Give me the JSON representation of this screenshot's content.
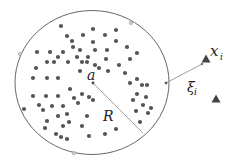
{
  "diagram": {
    "colors": {
      "circle_stroke": "#555555",
      "dot_fill": "#555555",
      "support_vector_fill": "#c8c8c8",
      "triangle_fill": "#444444",
      "line": "#888888",
      "text": "#222222"
    },
    "sphere": {
      "cx": 92,
      "cy": 82.5,
      "rx": 77,
      "ry": 72
    },
    "labels": {
      "center": "a",
      "radius": "R",
      "outlier": "x",
      "outlier_sub": "i",
      "slack": "ξ",
      "slack_sub": "i"
    },
    "support_vectors": [
      [
        131,
        23
      ],
      [
        20,
        54
      ],
      [
        74,
        153
      ],
      [
        166,
        83
      ]
    ],
    "outliers": [
      [
        206,
        59
      ],
      [
        216,
        99
      ]
    ],
    "points": [
      [
        61,
        26
      ],
      [
        116,
        30
      ],
      [
        93,
        29
      ],
      [
        67,
        36
      ],
      [
        83,
        35
      ],
      [
        105,
        35
      ],
      [
        72,
        41
      ],
      [
        93,
        42
      ],
      [
        116,
        41
      ],
      [
        127,
        47
      ],
      [
        73,
        47
      ],
      [
        80,
        50
      ],
      [
        95,
        50
      ],
      [
        107,
        50
      ],
      [
        37,
        52
      ],
      [
        50,
        52
      ],
      [
        63,
        52
      ],
      [
        137,
        53
      ],
      [
        58,
        57
      ],
      [
        77,
        57
      ],
      [
        88,
        57
      ],
      [
        106,
        59
      ],
      [
        130,
        59
      ],
      [
        47,
        62
      ],
      [
        54,
        62
      ],
      [
        68,
        62
      ],
      [
        82,
        62
      ],
      [
        87,
        62
      ],
      [
        95,
        65
      ],
      [
        99,
        68
      ],
      [
        119,
        65
      ],
      [
        36,
        68
      ],
      [
        80,
        71
      ],
      [
        108,
        71
      ],
      [
        125,
        73
      ],
      [
        33,
        78
      ],
      [
        47,
        78
      ],
      [
        58,
        78
      ],
      [
        137,
        79
      ],
      [
        130,
        83
      ],
      [
        142,
        85
      ],
      [
        147,
        85
      ],
      [
        33,
        96
      ],
      [
        46,
        96
      ],
      [
        58,
        96
      ],
      [
        70,
        89
      ],
      [
        74,
        98
      ],
      [
        82,
        94
      ],
      [
        89,
        97
      ],
      [
        93,
        100
      ],
      [
        137,
        94
      ],
      [
        146,
        97
      ],
      [
        133,
        100
      ],
      [
        24,
        109
      ],
      [
        39,
        105
      ],
      [
        52,
        106
      ],
      [
        63,
        106
      ],
      [
        78,
        103
      ],
      [
        43,
        110
      ],
      [
        58,
        116
      ],
      [
        67,
        114
      ],
      [
        87,
        116
      ],
      [
        136,
        111
      ],
      [
        143,
        105
      ],
      [
        151,
        108
      ],
      [
        148,
        113
      ],
      [
        47,
        121
      ],
      [
        63,
        126
      ],
      [
        69,
        122
      ],
      [
        82,
        126
      ],
      [
        45,
        128
      ],
      [
        116,
        129
      ],
      [
        140,
        122
      ],
      [
        56,
        134
      ],
      [
        61,
        137
      ],
      [
        67,
        139
      ],
      [
        89,
        136
      ],
      [
        105,
        134
      ]
    ]
  }
}
